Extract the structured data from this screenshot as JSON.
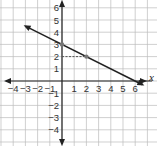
{
  "chart_data": {
    "type": "line",
    "title": "",
    "xlabel": "x",
    "ylabel": "",
    "xlim": [
      -5,
      7
    ],
    "ylim": [
      -5,
      7
    ],
    "grid": true,
    "x_ticks": [
      "-4",
      "-3",
      "-2",
      "-1",
      "1",
      "2",
      "3",
      "4",
      "5",
      "6"
    ],
    "y_ticks": [
      "6",
      "5",
      "4",
      "3",
      "2",
      "1",
      "-1",
      "-2",
      "-3",
      "-4"
    ],
    "series": [
      {
        "name": "line",
        "type": "line",
        "arrows": "both",
        "points": [
          {
            "x": -3,
            "y": 4.5
          },
          {
            "x": 6.6,
            "y": -0.3
          }
        ],
        "equation": "y = -0.5x + 3"
      },
      {
        "name": "marked points",
        "type": "scatter",
        "points": [
          {
            "x": 0,
            "y": 3
          },
          {
            "x": 2,
            "y": 2
          }
        ]
      },
      {
        "name": "dashed guide",
        "type": "line",
        "style": "dashed",
        "points": [
          {
            "x": 0,
            "y": 2
          },
          {
            "x": 2,
            "y": 2
          }
        ]
      }
    ],
    "colors": {
      "line": "#222222",
      "grid": "#bbbbbb",
      "dashed": "#555555",
      "point": "#777777"
    }
  }
}
